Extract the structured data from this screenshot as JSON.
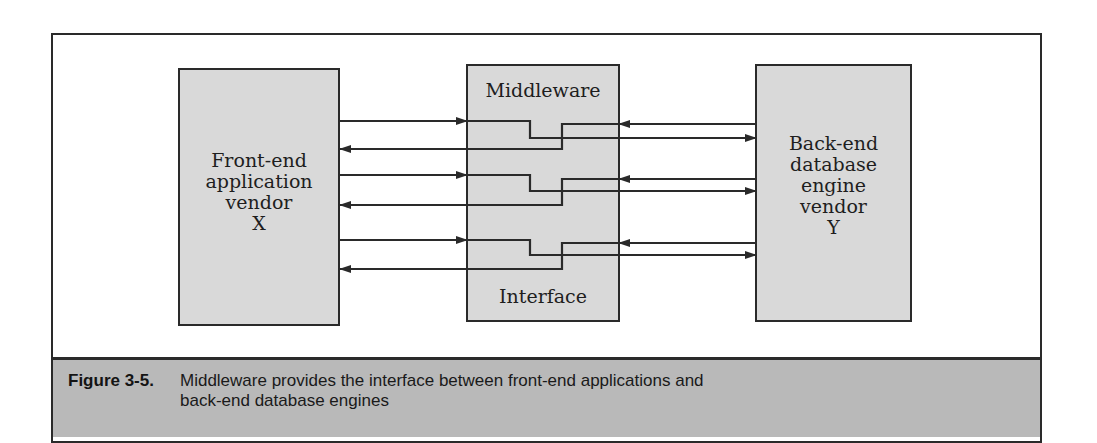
{
  "figure": {
    "number": "Figure 3-5.",
    "caption": "Middleware provides the interface between front-end applications and back-end database engines"
  },
  "boxes": {
    "front_end": {
      "lines": [
        "Front-end",
        "application",
        "vendor",
        "X"
      ]
    },
    "middleware": {
      "top_label": "Middleware",
      "bottom_label": "Interface"
    },
    "back_end": {
      "lines": [
        "Back-end",
        "database",
        "engine",
        "vendor",
        "Y"
      ]
    }
  },
  "colors": {
    "box_fill": "#d9d9d9",
    "stroke": "#2a2a2a",
    "caption_fill": "#b9b9b9"
  },
  "connections": [
    {
      "request_y": 121,
      "request_drop_y": 138,
      "response_in_y": 124,
      "response_out_y": 149
    },
    {
      "request_y": 175,
      "request_drop_y": 191,
      "response_in_y": 179,
      "response_out_y": 205
    },
    {
      "request_y": 240,
      "request_drop_y": 255,
      "response_in_y": 243,
      "response_out_y": 269
    }
  ]
}
